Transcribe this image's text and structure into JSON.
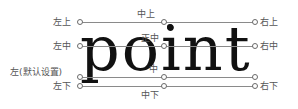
{
  "diagram": {
    "word": "point",
    "labels": {
      "top_left": "左上",
      "top_center": "中上",
      "top_right": "右上",
      "middle_left": "左中",
      "middle_center": "正中",
      "middle_right": "右中",
      "baseline_left": "左(默认设置)",
      "baseline_center": "中",
      "bottom_left": "左下",
      "bottom_center": "中下",
      "bottom_right": "右下"
    },
    "colors": {
      "text": "#111111",
      "guide_line": "#8a8a8a",
      "label": "#555555"
    }
  }
}
